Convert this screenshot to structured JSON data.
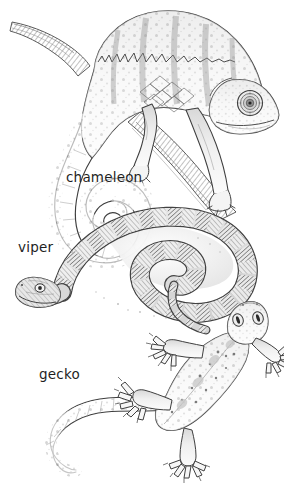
{
  "plate": {
    "title": "Reptiles illustration plate",
    "medium": "pencil and ink line drawing",
    "background_color": "#ffffff",
    "ink_color": "#3a3a3a",
    "label_color": "#1f1f1f",
    "width": 284,
    "height": 498
  },
  "labels": {
    "chameleon": "chameleon",
    "viper": "viper",
    "gecko": "gecko"
  },
  "figures": [
    {
      "id": "chameleon",
      "label": "chameleon",
      "description": "Chameleon gripping a diagonal branch, head to the right, tail coiled in a tight spiral at lower left",
      "features": [
        "turreted eye",
        "casque crest",
        "spiral prehensile tail",
        "lattice flank pattern",
        "zygodactyl grasping feet",
        "spotted skin"
      ],
      "label_position": {
        "x": 66,
        "y": 171
      }
    },
    {
      "id": "viper",
      "label": "viper",
      "description": "Coiled viper seen from above, head at lower left with tongue-length snout, body looped into a flat spiral with banded saddles",
      "features": [
        "banded dorsal saddles",
        "keeled scales",
        "coiled body",
        "triangular head",
        "round eye"
      ],
      "label_position": {
        "x": 18,
        "y": 241
      }
    },
    {
      "id": "gecko",
      "label": "gecko",
      "description": "Gecko viewed from above climbing upward, four splayed limbs with expanded toe pads, long banded tail curving to the lower left",
      "features": [
        "expanded toe pads",
        "splayed digits",
        "granular spotted skin",
        "long tapering tail",
        "large lidless eyes"
      ],
      "label_position": {
        "x": 39,
        "y": 368
      }
    }
  ]
}
